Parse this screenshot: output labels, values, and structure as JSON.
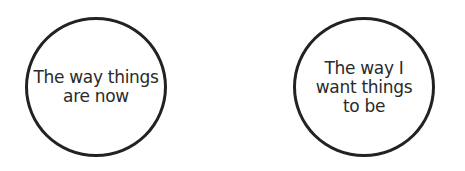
{
  "diagram": {
    "nodes": [
      {
        "id": "current",
        "shape": "circle",
        "label": "The way things\nare now"
      },
      {
        "id": "desired",
        "shape": "circle",
        "label": "The way I\nwant things\nto be"
      }
    ],
    "colors": {
      "stroke": "#222222",
      "text": "#2a2a2a",
      "background": "#ffffff"
    }
  }
}
